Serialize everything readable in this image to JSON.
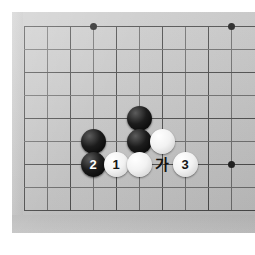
{
  "figure": {
    "kind": "go-board-diagram",
    "board_size": 19,
    "visible_grid": {
      "cols": 10,
      "rows": 9
    },
    "colors": {
      "board": "#c9c9c9",
      "gridline": "#4a4a4a",
      "black_stone": "#111111",
      "white_stone": "#f2f2f2",
      "page_background": "#ffffff"
    }
  },
  "grid": {
    "vertical_x": [
      24,
      47,
      70,
      93,
      116,
      139,
      162,
      185,
      208,
      231
    ],
    "horizontal_y": [
      26,
      49,
      72,
      95,
      118,
      141,
      164,
      187,
      210
    ],
    "spacing_px": 23
  },
  "star_points": [
    {
      "name": "star-top",
      "x": 93,
      "y": 26
    },
    {
      "name": "star-top-right",
      "x": 231,
      "y": 26
    },
    {
      "name": "star-right",
      "x": 231,
      "y": 164
    }
  ],
  "stones": [
    {
      "id": "black-upper",
      "color": "black",
      "x": 139,
      "y": 118,
      "label": ""
    },
    {
      "id": "black-middle",
      "color": "black",
      "x": 139,
      "y": 141,
      "label": ""
    },
    {
      "id": "black-left",
      "color": "black",
      "x": 93,
      "y": 141,
      "label": ""
    },
    {
      "id": "black-move-2",
      "color": "black",
      "x": 93,
      "y": 164,
      "label": "2"
    },
    {
      "id": "white-move-1",
      "color": "white",
      "x": 116,
      "y": 164,
      "label": "1"
    },
    {
      "id": "white-plain",
      "color": "white",
      "x": 139,
      "y": 164,
      "label": ""
    },
    {
      "id": "white-right",
      "color": "white",
      "x": 162,
      "y": 141,
      "label": ""
    },
    {
      "id": "white-move-3",
      "color": "white",
      "x": 185,
      "y": 164,
      "label": "3"
    }
  ],
  "point_labels": [
    {
      "id": "point-ga",
      "text": "가",
      "x": 162,
      "y": 164
    }
  ]
}
